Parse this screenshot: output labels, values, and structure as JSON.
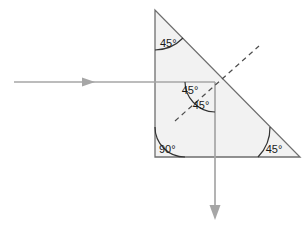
{
  "figure": {
    "background_color": "#ffffff"
  },
  "prism": {
    "name": "right-isoceles-prism",
    "fill_color": "#f2f2f2",
    "stroke_color": "#6e6e6e",
    "vertices": {
      "top": [
        155,
        10
      ],
      "bottom_left": [
        155,
        157
      ],
      "bottom_right": [
        300,
        157
      ]
    }
  },
  "rays": {
    "color": "#a6a6a6",
    "incident": {
      "label": "incident-ray",
      "from": [
        14,
        82
      ],
      "to": [
        215,
        82
      ],
      "arrow_at": [
        95,
        82
      ],
      "direction": "right"
    },
    "reflected": {
      "label": "reflected-ray",
      "from": [
        215,
        82
      ],
      "to": [
        215,
        220
      ],
      "arrow_at": [
        215,
        220
      ],
      "direction": "down"
    },
    "intersection_point": [
      215,
      82
    ]
  },
  "normal_line": {
    "label": "normal-dashed-line",
    "from": [
      175,
      121
    ],
    "to": [
      259,
      46
    ],
    "style": "dashed",
    "color": "#4d4d4d"
  },
  "angles": [
    {
      "id": "apex-angle",
      "value": "45",
      "unit": "°",
      "text": "45°",
      "vertex": [
        155,
        10
      ],
      "label_pos": [
        162,
        44
      ]
    },
    {
      "id": "incident-angle",
      "value": "45",
      "unit": "°",
      "text": "45°",
      "vertex": [
        215,
        82
      ],
      "label_pos": [
        190,
        92
      ]
    },
    {
      "id": "reflection-angle",
      "value": "45",
      "unit": "°",
      "text": "45°",
      "vertex": [
        215,
        82
      ],
      "label_pos": [
        199,
        106
      ]
    },
    {
      "id": "right-angle",
      "value": "90",
      "unit": "°",
      "text": "90°",
      "vertex": [
        155,
        157
      ],
      "label_pos": [
        161,
        148
      ]
    },
    {
      "id": "base-angle",
      "value": "45",
      "unit": "°",
      "text": "45°",
      "vertex": [
        300,
        157
      ],
      "label_pos": [
        262,
        149
      ]
    }
  ],
  "arcs": {
    "stroke_color": "#333333"
  }
}
